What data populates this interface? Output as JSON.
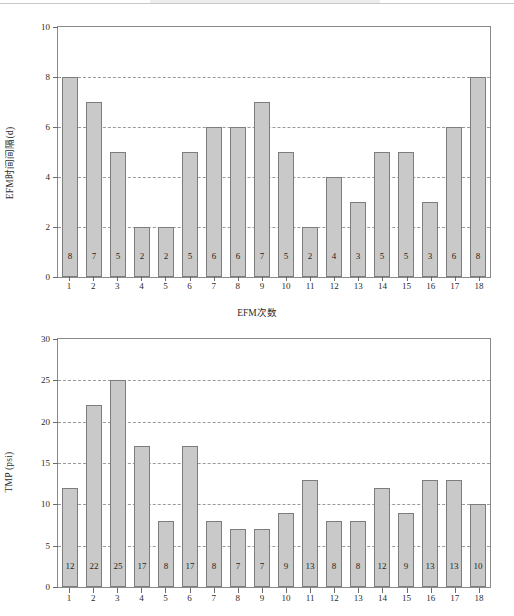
{
  "page": {
    "background": "#ffffff",
    "bar_fill": "#c9c9c9",
    "bar_edge": "#7d7d7d",
    "grid_color": "#9a9a9a",
    "axis_color": "#8a8a8a"
  },
  "chart_data": [
    {
      "type": "bar",
      "title": "",
      "xlabel": "EFM次数",
      "ylabel": "EFM时间间隔(d)",
      "categories": [
        "1",
        "2",
        "3",
        "4",
        "5",
        "6",
        "7",
        "8",
        "9",
        "10",
        "11",
        "12",
        "13",
        "14",
        "15",
        "16",
        "17",
        "18"
      ],
      "values": [
        8,
        7,
        5,
        2,
        2,
        5,
        6,
        6,
        7,
        5,
        2,
        4,
        3,
        5,
        5,
        3,
        6,
        8
      ],
      "ylim": [
        0,
        10
      ],
      "yticks": [
        0,
        2,
        4,
        6,
        8,
        10
      ],
      "ytick_labels": [
        "0",
        "2",
        "4",
        "6",
        "8",
        "10"
      ],
      "gridlines": [
        2,
        4,
        6,
        8
      ],
      "grid": true,
      "legend": "none",
      "data_labels": [
        "8",
        "7",
        "5",
        "2",
        "2",
        "5",
        "6",
        "6",
        "7",
        "5",
        "2",
        "4",
        "3",
        "5",
        "5",
        "3",
        "6",
        "8"
      ]
    },
    {
      "type": "bar",
      "title": "",
      "xlabel": "EFM次数",
      "ylabel": "TMP (psi)",
      "categories": [
        "1",
        "2",
        "3",
        "4",
        "5",
        "6",
        "7",
        "8",
        "9",
        "10",
        "11",
        "12",
        "13",
        "14",
        "15",
        "16",
        "17",
        "18"
      ],
      "values": [
        12,
        22,
        25,
        17,
        8,
        17,
        8,
        7,
        7,
        9,
        13,
        8,
        8,
        12,
        9,
        13,
        13,
        10
      ],
      "ylim": [
        0,
        30
      ],
      "yticks": [
        0,
        5,
        10,
        15,
        20,
        25,
        30
      ],
      "ytick_labels": [
        "0",
        "5",
        "10",
        "15",
        "20",
        "25",
        "30"
      ],
      "gridlines": [
        5,
        10,
        15,
        20,
        25
      ],
      "grid": true,
      "legend": "none",
      "data_labels": [
        "12",
        "22",
        "25",
        "17",
        "8",
        "17",
        "8",
        "7",
        "7",
        "9",
        "13",
        "8",
        "8",
        "12",
        "9",
        "13",
        "13",
        "10"
      ]
    }
  ]
}
